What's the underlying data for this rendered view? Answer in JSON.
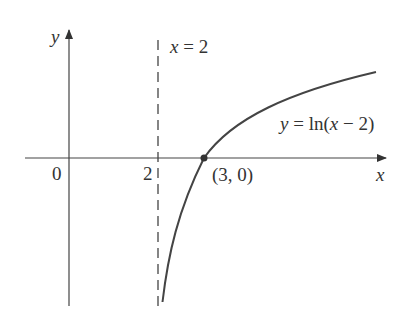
{
  "diagram": {
    "type": "function-graph",
    "function": "y = ln(x - 2)",
    "axes": {
      "x_label": "x",
      "y_label": "y",
      "origin_label": "0",
      "tick_labels": [
        "2"
      ]
    },
    "asymptote": {
      "equation": "x = 2",
      "style": "dashed"
    },
    "point": {
      "label": "(3, 0)",
      "x": 3,
      "y": 0
    },
    "curve_label": "y = ln(x − 2)",
    "colors": {
      "ink": "#333333",
      "background": "#ffffff"
    }
  },
  "labels": {
    "y_axis": "y",
    "x_axis": "x",
    "origin": "0",
    "tick_2": "2",
    "asymptote": "x = 2",
    "point": "(3, 0)",
    "curve": "y = ln(x − 2)"
  }
}
